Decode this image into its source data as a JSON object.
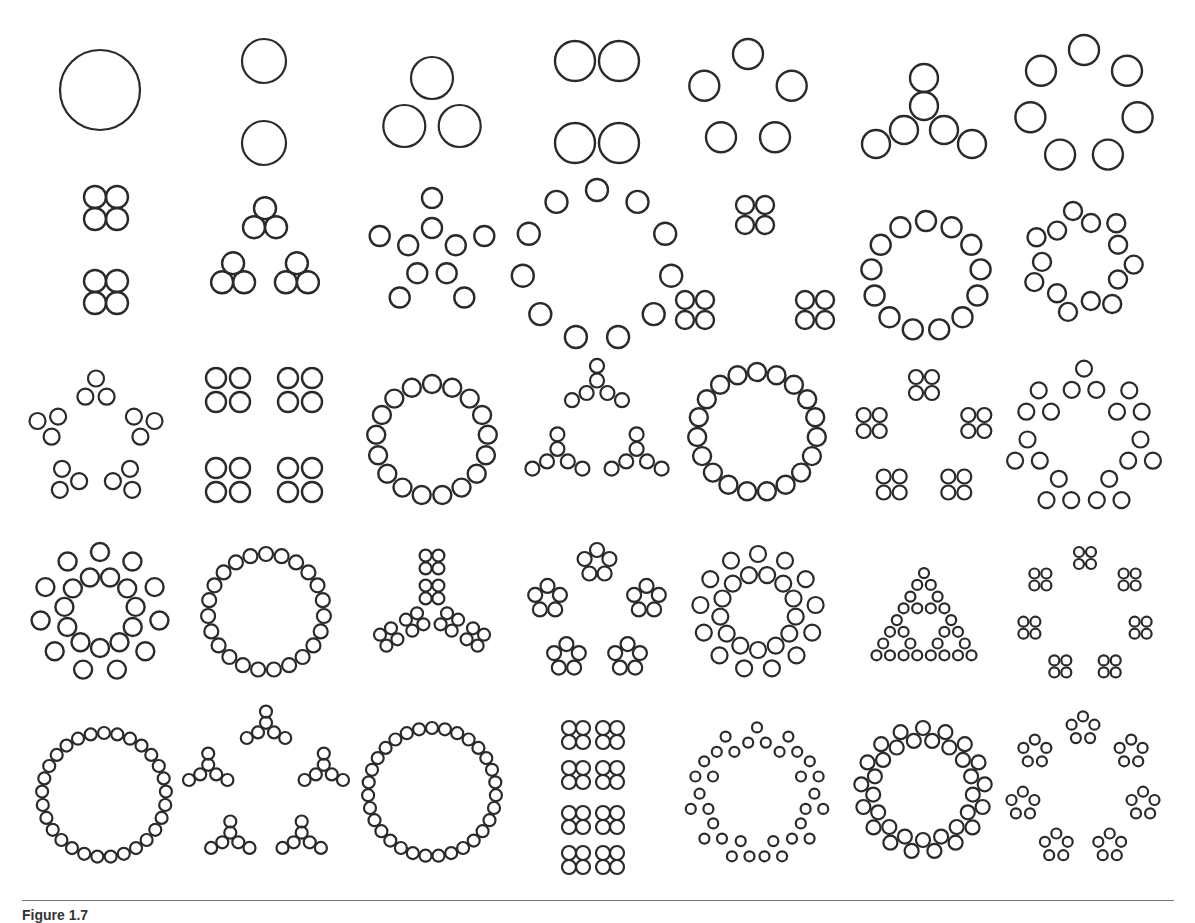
{
  "figure": {
    "caption": "Figure 1.7",
    "stroke_color": "#2a2a2a",
    "rule_color": "#777777",
    "grid": {
      "cols": 7,
      "rows": 5
    },
    "cells": [
      {
        "n": 1,
        "cx": 100,
        "cy": 90,
        "spec": [
          "ring",
          1,
          40,
          0
        ]
      },
      {
        "n": 2,
        "cx": 264,
        "cy": 102,
        "spec": [
          "line2v",
          82,
          22
        ]
      },
      {
        "n": 3,
        "cx": 432,
        "cy": 110,
        "spec": [
          "ring",
          3,
          32,
          21
        ]
      },
      {
        "n": 4,
        "cx": 597,
        "cy": 102,
        "spec": [
          "grid",
          2,
          2,
          44,
          82,
          20
        ]
      },
      {
        "n": 5,
        "cx": 748,
        "cy": 100,
        "spec": [
          "ring",
          5,
          46,
          15
        ]
      },
      {
        "n": 6,
        "cx": 924,
        "cy": 122,
        "spec": [
          "y6",
          1.0,
          14
        ]
      },
      {
        "n": 7,
        "cx": 1084,
        "cy": 105,
        "spec": [
          "ring",
          7,
          55,
          15
        ]
      },
      {
        "n": 8,
        "cx": 106,
        "cy": 250,
        "spec": [
          "grid2x2s",
          [
            [
              0,
              -42
            ],
            [
              0,
              42
            ]
          ],
          22,
          11
        ]
      },
      {
        "n": 9,
        "cx": 265,
        "cy": 255,
        "spec": [
          "tri_of_tri",
          58,
          20,
          11
        ]
      },
      {
        "n": 10,
        "cx": 432,
        "cy": 253,
        "spec": [
          "pairs",
          5,
          25,
          55,
          10
        ]
      },
      {
        "n": 11,
        "cx": 597,
        "cy": 265,
        "spec": [
          "ring",
          11,
          75,
          11
        ]
      },
      {
        "n": 12,
        "cx": 755,
        "cy": 270,
        "spec": [
          "grid2x2s",
          [
            [
              0,
              -55
            ],
            [
              -60,
              40
            ],
            [
              60,
              40
            ]
          ],
          20,
          9
        ]
      },
      {
        "n": 13,
        "cx": 926,
        "cy": 276,
        "spec": [
          "ring",
          13,
          55,
          10
        ]
      },
      {
        "n": 14,
        "cx": 1082,
        "cy": 262,
        "spec": [
          "pairs7",
          45,
          18,
          9
        ]
      },
      {
        "n": 15,
        "cx": 96,
        "cy": 440,
        "spec": [
          "pent_groups",
          3,
          50,
          12,
          8
        ]
      },
      {
        "n": 16,
        "cx": 264,
        "cy": 435,
        "spec": [
          "grid2x2s",
          [
            [
              -36,
              -45
            ],
            [
              36,
              -45
            ],
            [
              -36,
              45
            ],
            [
              36,
              45
            ]
          ],
          24,
          10
        ]
      },
      {
        "n": 17,
        "cx": 432,
        "cy": 440,
        "spec": [
          "ring",
          17,
          56,
          9
        ]
      },
      {
        "n": 18,
        "cx": 597,
        "cy": 432,
        "spec": [
          "tri_of_y6",
          48,
          0.52,
          7
        ]
      },
      {
        "n": 19,
        "cx": 757,
        "cy": 432,
        "spec": [
          "ring",
          19,
          60,
          9
        ]
      },
      {
        "n": 20,
        "cx": 924,
        "cy": 440,
        "spec": [
          "pent_2x2",
          55,
          16,
          7
        ]
      },
      {
        "n": 21,
        "cx": 1084,
        "cy": 440,
        "spec": [
          "hept_tri",
          58,
          14,
          8
        ]
      },
      {
        "n": 22,
        "cx": 100,
        "cy": 612,
        "spec": [
          "double_ring",
          11,
          60,
          36,
          9
        ]
      },
      {
        "n": 23,
        "cx": 266,
        "cy": 612,
        "spec": [
          "ring",
          23,
          58,
          7
        ]
      },
      {
        "n": 24,
        "cx": 432,
        "cy": 612,
        "spec": [
          "arms_2x2",
          3,
          16,
          50,
          15,
          6
        ]
      },
      {
        "n": 25,
        "cx": 597,
        "cy": 615,
        "spec": [
          "pent_groups5",
          52,
          13,
          7
        ]
      },
      {
        "n": 26,
        "cx": 758,
        "cy": 612,
        "spec": [
          "double_ring",
          13,
          58,
          38,
          8
        ]
      },
      {
        "n": 27,
        "cx": 924,
        "cy": 615,
        "spec": [
          "sierpinski",
          3,
          13,
          5
        ]
      },
      {
        "n": 28,
        "cx": 1085,
        "cy": 615,
        "spec": [
          "hept_2x2",
          57,
          12,
          5
        ]
      },
      {
        "n": 29,
        "cx": 104,
        "cy": 795,
        "spec": [
          "ring",
          29,
          62,
          6
        ]
      },
      {
        "n": 30,
        "cx": 266,
        "cy": 790,
        "spec": [
          "pent_y6",
          45,
          0.4,
          6
        ]
      },
      {
        "n": 31,
        "cx": 432,
        "cy": 792,
        "spec": [
          "ring",
          31,
          64,
          6
        ]
      },
      {
        "n": 32,
        "cx": 593,
        "cy": 795,
        "spec": [
          "grid2x2s",
          [
            [
              -17,
              -60
            ],
            [
              17,
              -60
            ],
            [
              -17,
              -20
            ],
            [
              17,
              -20
            ],
            [
              -17,
              25
            ],
            [
              17,
              25
            ],
            [
              -17,
              65
            ],
            [
              17,
              65
            ]
          ],
          14,
          7
        ]
      },
      {
        "n": 33,
        "cx": 757,
        "cy": 795,
        "spec": [
          "ring_tri",
          11,
          58,
          10,
          5
        ]
      },
      {
        "n": 34,
        "cx": 923,
        "cy": 790,
        "spec": [
          "double_pairs",
          17,
          62,
          50,
          7
        ]
      },
      {
        "n": 35,
        "cx": 1083,
        "cy": 790,
        "spec": [
          "hept_pent",
          56,
          12,
          5
        ]
      }
    ]
  }
}
